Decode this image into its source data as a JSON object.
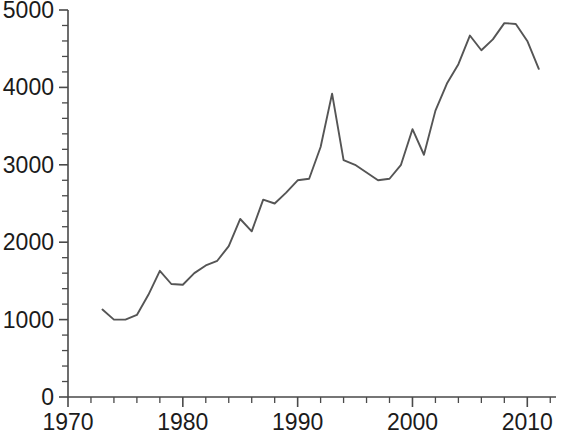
{
  "chart_data": {
    "type": "line",
    "title": "",
    "subtitle": "",
    "xlabel": "",
    "ylabel": "",
    "xlim": [
      1970,
      2012.5
    ],
    "ylim": [
      0,
      5000
    ],
    "grid": false,
    "legend": null,
    "line_color": "#555555",
    "axis_color": "#4a4a4a",
    "background_color": "#ffffff",
    "x_ticks_major": [
      1970,
      1980,
      1990,
      2000,
      2010
    ],
    "x_tick_labels": [
      "1970",
      "1980",
      "1990",
      "2000",
      "2010"
    ],
    "x_ticks_minor": [
      1972,
      1974,
      1976,
      1978,
      1982,
      1984,
      1986,
      1988,
      1992,
      1994,
      1996,
      1998,
      2002,
      2004,
      2006,
      2008,
      2012
    ],
    "y_ticks_major": [
      0,
      1000,
      2000,
      3000,
      4000,
      5000
    ],
    "y_tick_labels": [
      "0",
      "1000",
      "2000",
      "3000",
      "4000",
      "5000"
    ],
    "y_ticks_minor": [
      200,
      400,
      600,
      800,
      1200,
      1400,
      1600,
      1800,
      2200,
      2400,
      2600,
      2800,
      3200,
      3400,
      3600,
      3800,
      4200,
      4400,
      4600,
      4800
    ],
    "series": [
      {
        "name": "series-1",
        "x": [
          1973,
          1974,
          1975,
          1976,
          1977,
          1978,
          1979,
          1980,
          1981,
          1982,
          1983,
          1984,
          1985,
          1986,
          1987,
          1988,
          1989,
          1990,
          1991,
          1992,
          1993,
          1994,
          1995,
          1996,
          1997,
          1998,
          1999,
          2000,
          2001,
          2002,
          2003,
          2004,
          2005,
          2006,
          2007,
          2008,
          2009,
          2010,
          2011
        ],
        "values": [
          1130,
          1000,
          1000,
          1060,
          1320,
          1630,
          1460,
          1450,
          1600,
          1700,
          1760,
          1950,
          2300,
          2140,
          2550,
          2500,
          2640,
          2800,
          2820,
          3230,
          3920,
          3060,
          3000,
          2900,
          2800,
          2820,
          3000,
          3460,
          3130,
          3700,
          4050,
          4300,
          4670,
          4480,
          4620,
          4830,
          4820,
          4600,
          4240
        ]
      }
    ]
  }
}
